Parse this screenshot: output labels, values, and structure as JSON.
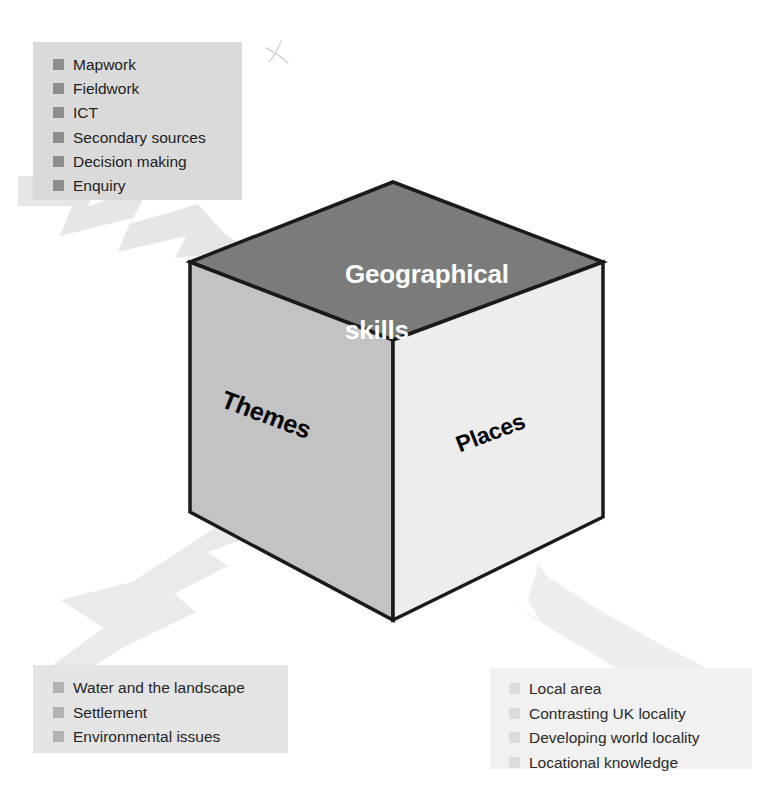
{
  "diagram": {
    "colors": {
      "page_background": "#ffffff",
      "cube_top_face": "#7b7b7b",
      "cube_left_face": "#c3c3c3",
      "cube_right_face": "#ededed",
      "cube_outline": "#1a1a1a",
      "arrow_fill": "#e6e6e6",
      "skills_box_background": "#dadada",
      "themes_box_background": "#e4e4e4",
      "places_box_background": "#f1f1f1",
      "skills_bullet": "#8d8d8d",
      "themes_bullet": "#b2b2b2",
      "places_bullet": "#dcdcdc",
      "top_face_text": "#ffffff",
      "side_face_text": "#000000"
    },
    "cube": {
      "faces": [
        {
          "id": "top",
          "label": "Geographical\nskills",
          "label_line_1": "Geographical",
          "label_line_2": "skills",
          "fill": "#7b7b7b",
          "text_color": "#ffffff"
        },
        {
          "id": "left",
          "label": "Themes",
          "fill": "#c3c3c3",
          "text_color": "#000000"
        },
        {
          "id": "right",
          "label": "Places",
          "fill": "#ededed",
          "text_color": "#000000"
        }
      ]
    },
    "callouts": [
      {
        "id": "skills",
        "points_to": "top",
        "items": [
          "Mapwork",
          "Fieldwork",
          "ICT",
          "Secondary sources",
          "Decision making",
          "Enquiry"
        ]
      },
      {
        "id": "themes",
        "points_to": "left",
        "items": [
          "Water and the landscape",
          "Settlement",
          "Environmental issues"
        ]
      },
      {
        "id": "places",
        "points_to": "right",
        "items": [
          "Local area",
          "Contrasting UK locality",
          "Developing world locality",
          "Locational knowledge"
        ]
      }
    ],
    "annotations": [
      {
        "id": "scan-mark",
        "kind": "handwritten-mark",
        "glyph": "x"
      }
    ]
  }
}
